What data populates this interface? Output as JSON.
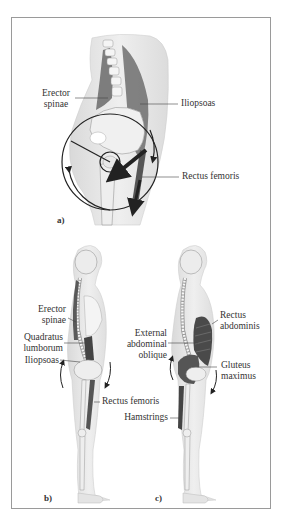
{
  "figure": {
    "panels": [
      {
        "id": "a",
        "label": "a)",
        "view": "hip region, lateral",
        "labels": {
          "erector_spinae": [
            "Erector",
            "spinae"
          ],
          "iliopsoas": "Iliopsoas",
          "rectus_femoris": "Rectus femoris"
        }
      },
      {
        "id": "b",
        "label": "b)",
        "view": "full body, lateral",
        "labels": {
          "erector_spinae": [
            "Erector",
            "spinae"
          ],
          "quadratus_lumborum": [
            "Quadratus",
            "lumborum"
          ],
          "iliopsoas": "Iliopsoas",
          "rectus_femoris": "Rectus femoris"
        }
      },
      {
        "id": "c",
        "label": "c)",
        "view": "full body, lateral",
        "labels": {
          "rectus_abdominis": [
            "Rectus",
            "abdominis"
          ],
          "external_abdominal_oblique": [
            "External",
            "abdominal",
            "oblique"
          ],
          "gluteus_maximus": [
            "Gluteus",
            "maximus"
          ],
          "hamstrings": "Hamstrings"
        }
      }
    ],
    "colors": {
      "border": "#9a9a9a",
      "skin": "#e6e6e6",
      "bone": "#f4f4f4",
      "muscle": "#555555",
      "leader_line": "#444444",
      "arrow": "#222222"
    }
  }
}
